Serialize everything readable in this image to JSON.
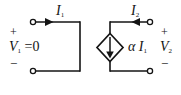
{
  "diagram": {
    "stroke_color": "#141414",
    "background_color": "#ffffff",
    "labels": {
      "i1": "I",
      "i1_sub": "1",
      "i2": "I",
      "i2_sub": "2",
      "v1": "V",
      "v1_sub": "1",
      "v1_value": " =0",
      "v2": "V",
      "v2_sub": "2",
      "alpha": "α",
      "alpha_current": "I",
      "alpha_current_sub": "1",
      "plus_left": "+",
      "minus_left": "−",
      "plus_right": "+",
      "minus_right": "−"
    },
    "elements": {
      "source_type": "dependent-current-source",
      "source_shape": "diamond",
      "source_arrow_direction": "down",
      "i1_arrow_direction": "right",
      "i2_arrow_direction": "left",
      "left_port_state": "short-circuit"
    }
  }
}
